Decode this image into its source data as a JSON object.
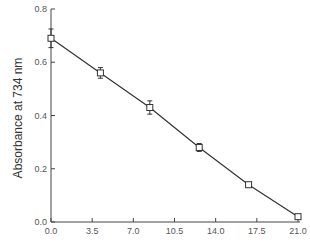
{
  "chart_data": {
    "type": "line",
    "title": "",
    "xlabel": "",
    "ylabel": "Absorbance at 734 nm",
    "xlim": [
      0.0,
      21.0
    ],
    "ylim": [
      0.0,
      0.8
    ],
    "x_ticks": [
      "0.0",
      "3.5",
      "7.0",
      "10.5",
      "14.0",
      "17.5",
      "21.0"
    ],
    "y_ticks": [
      "0.0",
      "0.2",
      "0.4",
      "0.6",
      "0.8"
    ],
    "grid": false,
    "legend": null,
    "marker": "open-square",
    "error_bars": true,
    "series": [
      {
        "name": "Absorbance",
        "x": [
          0.0,
          4.2,
          8.4,
          12.6,
          16.8,
          21.0
        ],
        "y": [
          0.69,
          0.56,
          0.43,
          0.28,
          0.14,
          0.02
        ],
        "yerr": [
          0.035,
          0.02,
          0.025,
          0.015,
          0.005,
          0.005
        ]
      }
    ],
    "colors": {
      "line": "#333333",
      "axis": "#444444"
    }
  }
}
